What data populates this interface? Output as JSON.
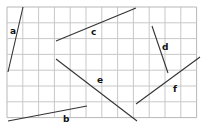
{
  "diagram": {
    "type": "grid-line-segments",
    "grid": {
      "x0": 7,
      "y0": 7,
      "cell": 15.8,
      "cols": 12,
      "rows": 7,
      "line_color": "#c8c8c8",
      "border_color": "#b8b8b8"
    },
    "segment_color": "#333333",
    "segments": [
      {
        "label": "a",
        "x1": 23,
        "y1": 7,
        "x2": 8,
        "y2": 72,
        "lx": 10,
        "ly": 27
      },
      {
        "label": "b",
        "x1": 8,
        "y1": 121,
        "x2": 87,
        "y2": 106,
        "lx": 63,
        "ly": 115
      },
      {
        "label": "c",
        "x1": 56,
        "y1": 41,
        "x2": 136,
        "y2": 8,
        "lx": 91,
        "ly": 28
      },
      {
        "label": "d",
        "x1": 152,
        "y1": 26,
        "x2": 168,
        "y2": 73,
        "lx": 162,
        "ly": 43
      },
      {
        "label": "e",
        "x1": 56,
        "y1": 59,
        "x2": 137,
        "y2": 121,
        "lx": 97,
        "ly": 76
      },
      {
        "label": "f",
        "x1": 136,
        "y1": 104,
        "x2": 200,
        "y2": 57,
        "lx": 173,
        "ly": 85
      }
    ]
  }
}
